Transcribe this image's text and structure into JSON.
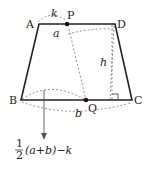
{
  "figure": {
    "type": "trapezoid-diagram",
    "vertices": {
      "A": "A",
      "D": "D",
      "B": "B",
      "C": "C",
      "P": "P",
      "Q": "Q"
    },
    "dimension_labels": {
      "k": "k",
      "a": "a",
      "b": "b",
      "h": "h"
    },
    "formula": {
      "numerator": "1",
      "denominator": "2",
      "rest": "(a+b)−k"
    },
    "colors": {
      "line": "#222222",
      "dash": "#777777"
    }
  }
}
